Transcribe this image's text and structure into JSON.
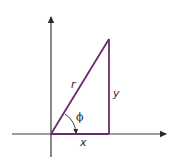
{
  "diagram": {
    "title": "",
    "colors": {
      "axis": "#3a3a3a",
      "triangle": "#6a2c6e",
      "text": "#2a2a2a",
      "background": "#ffffff"
    },
    "labels": {
      "hypotenuse": "r",
      "opposite": "y",
      "adjacent": "x",
      "angle": "ϕ"
    },
    "geometry": {
      "origin": [
        51,
        134
      ],
      "apex": [
        109,
        39
      ],
      "right_angle_corner": [
        109,
        134
      ],
      "x_axis": {
        "from": [
          12,
          134
        ],
        "to": [
          168,
          134
        ]
      },
      "y_axis": {
        "from": [
          51,
          157
        ],
        "to": [
          51,
          14
        ]
      }
    }
  }
}
